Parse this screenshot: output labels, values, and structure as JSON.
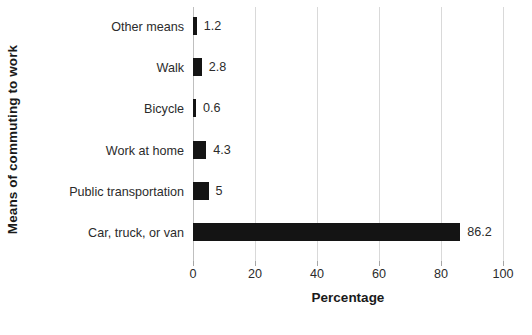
{
  "chart_data": {
    "type": "bar",
    "orientation": "horizontal",
    "title": "",
    "xlabel": "Percentage",
    "ylabel": "Means of commuting to work",
    "categories": [
      "Other means",
      "Walk",
      "Bicycle",
      "Work at home",
      "Public transportation",
      "Car, truck, or van"
    ],
    "values": [
      1.2,
      2.8,
      0.6,
      4.3,
      5,
      86.2
    ],
    "value_labels": [
      "1.2",
      "2.8",
      "0.6",
      "4.3",
      "5",
      "86.2"
    ],
    "xlim": [
      0,
      100
    ],
    "xticks": [
      0,
      20,
      40,
      60,
      80,
      100
    ],
    "xtick_labels": [
      "0",
      "20",
      "40",
      "60",
      "80",
      "100"
    ],
    "grid": true,
    "grid_axis": "x",
    "legend": false,
    "bar_color": "#141414",
    "grid_color": "#d9d9d9",
    "axis_color": "#bfbfbf",
    "text_color": "#2b2b2b"
  }
}
